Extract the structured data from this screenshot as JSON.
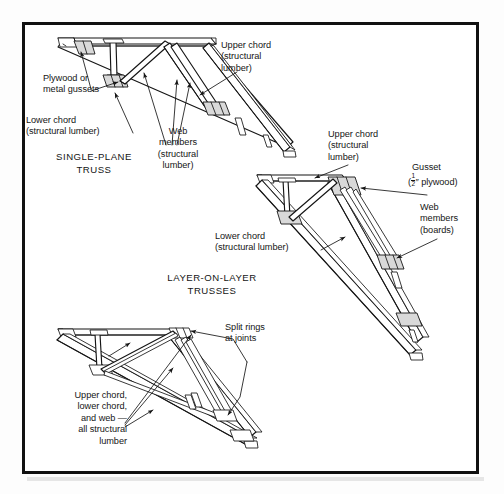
{
  "figure": {
    "border_color": "#111111",
    "background_color": "#ffffff",
    "line_color": "#151515"
  },
  "captions": [
    {
      "id": "single-plane",
      "text": "SINGLE-PLANE\nTRUSS",
      "x": 31,
      "y": 148
    },
    {
      "id": "layer-on-layer",
      "text": "LAYER-ON-LAYER\nTRUSSES",
      "x": 169,
      "y": 269
    }
  ],
  "labels": [
    {
      "id": "upper-chord-top",
      "text": "Upper chord\n(structural\nlumber)",
      "x": 218,
      "y": 37,
      "align": "left"
    },
    {
      "id": "plywood-metal-gussets",
      "text": "Plywood or\nmetal gussets",
      "x": 40,
      "y": 70,
      "align": "left"
    },
    {
      "id": "lower-chord-top",
      "text": "Lower chord\n(structural lumber)",
      "x": 23,
      "y": 112,
      "align": "left"
    },
    {
      "id": "web-members-top",
      "text": "Web\nmembers\n(structural\nlumber)",
      "x": 152,
      "y": 123,
      "align": "center"
    },
    {
      "id": "upper-chord-middle",
      "text": "Upper chord\n(structural\nlumber)",
      "x": 325,
      "y": 126,
      "align": "left"
    },
    {
      "id": "gusset-plywood",
      "text": "Gusset",
      "x": 409,
      "y": 159,
      "align": "left",
      "fraction_line": true,
      "fraction_prefix": "(",
      "fraction_num": "1",
      "fraction_den": "2",
      "fraction_suffix": "″ plywood)"
    },
    {
      "id": "web-members-middle",
      "text": "Web\nmembers\n(boards)",
      "x": 417,
      "y": 199,
      "align": "left"
    },
    {
      "id": "lower-chord-middle",
      "text": "Lower chord\n(structural lumber)",
      "x": 212,
      "y": 228,
      "align": "left"
    },
    {
      "id": "split-rings",
      "text": "Split rings\nat joints",
      "x": 222,
      "y": 319,
      "align": "left"
    },
    {
      "id": "all-structural-lumber",
      "text": "Upper chord,\nlower chord,\nand web —\nall structural\nlumber",
      "x": 24,
      "y": 387,
      "align": "right"
    }
  ],
  "trusses": [
    {
      "id": "single-plane-truss",
      "name": "Single-plane truss",
      "description": "Pitched truss drawn in perspective with plywood or metal gussets at joints; upper chord, lower chord and web members all of structural lumber."
    },
    {
      "id": "layer-on-layer-truss-upper",
      "name": "Layer-on-layer truss with plywood gussets",
      "description": "Layer-on-layer truss using 1/2-inch plywood gussets and board web members."
    },
    {
      "id": "layer-on-layer-truss-lower",
      "name": "Layer-on-layer truss with split rings",
      "description": "Layer-on-layer truss using split rings at joints; upper chord, lower chord and web all structural lumber."
    }
  ]
}
